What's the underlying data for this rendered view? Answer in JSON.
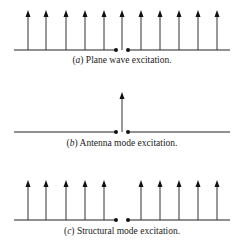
{
  "panels": [
    {
      "id": "a",
      "label": "a",
      "caption": "Plane wave excitation.",
      "line_y": 50,
      "arrows_x": [
        28,
        46,
        66,
        85,
        104,
        122,
        141,
        160,
        179,
        198,
        217
      ],
      "caption_y": 60
    },
    {
      "id": "b",
      "label": "b",
      "caption": "Antenna mode excitation.",
      "line_y": 132,
      "arrows_x": [
        122
      ],
      "caption_y": 143
    },
    {
      "id": "c",
      "label": "c",
      "caption": "Structural mode excitation.",
      "line_y": 220,
      "arrows_x": [
        28,
        46,
        66,
        85,
        104,
        141,
        160,
        179,
        198,
        217
      ],
      "caption_y": 229
    }
  ],
  "colors": {
    "line": "#222222",
    "arrow": "#333333"
  }
}
